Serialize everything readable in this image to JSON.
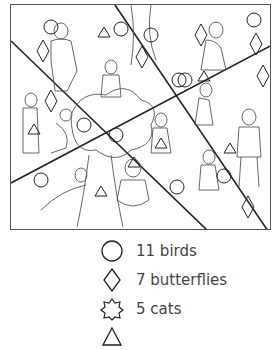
{
  "legend": {
    "items": [
      {
        "shape": "circle",
        "label": "11 birds"
      },
      {
        "shape": "diamond",
        "label": "7 butterflies"
      },
      {
        "shape": "star",
        "label": "5 cats"
      },
      {
        "shape": "triangle",
        "label": ""
      }
    ]
  }
}
